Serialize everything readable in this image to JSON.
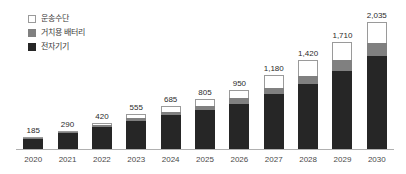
{
  "chart_data": {
    "type": "bar",
    "stacked": true,
    "title": "",
    "subtitle": "",
    "xlabel": "",
    "ylabel": "",
    "grid": false,
    "legend_position": "top-left",
    "ylim": [
      0,
      2035
    ],
    "categories": [
      "2020",
      "2021",
      "2022",
      "2023",
      "2024",
      "2025",
      "2026",
      "2027",
      "2028",
      "2029",
      "2030"
    ],
    "tick_labels": [
      "2020",
      "2021",
      "2022",
      "2023",
      "2024",
      "2025",
      "2026",
      "2027",
      "2028",
      "2029",
      "2030"
    ],
    "totals": [
      185,
      290,
      420,
      555,
      685,
      805,
      950,
      1180,
      1420,
      1710,
      2035
    ],
    "total_labels": [
      "185",
      "290",
      "420",
      "555",
      "685",
      "805",
      "950",
      "1,180",
      "1,420",
      "1,710",
      "2,035"
    ],
    "series": [
      {
        "name": "전자기기",
        "key": "electronics",
        "color": "#262626",
        "values": [
          160,
          250,
          355,
          455,
          545,
          625,
          725,
          880,
          1040,
          1255,
          1495
        ]
      },
      {
        "name": "거치용 배터리",
        "key": "stationary",
        "color": "#808080",
        "values": [
          10,
          15,
          25,
          40,
          55,
          70,
          85,
          105,
          130,
          165,
          210
        ]
      },
      {
        "name": "운송수단",
        "key": "transport",
        "color": "#ffffff",
        "values": [
          15,
          25,
          40,
          60,
          85,
          110,
          140,
          195,
          250,
          290,
          330
        ]
      }
    ]
  },
  "legend": {
    "items": [
      {
        "label": "운송수단",
        "swatch": "sw-transport",
        "icon": "legend-swatch-white-icon"
      },
      {
        "label": "거치용 배터리",
        "swatch": "sw-stationary",
        "icon": "legend-swatch-gray-icon"
      },
      {
        "label": "전자기기",
        "swatch": "sw-electronics",
        "icon": "legend-swatch-dark-icon"
      }
    ]
  },
  "colors": {
    "electronics": "#262626",
    "stationary": "#808080",
    "transport": "#ffffff",
    "transport_border": "#9a9a9a",
    "axis": "#b0b0b0",
    "label_text": "#2b2b2b",
    "tick_text": "#4a4a4a",
    "background": "#ffffff"
  }
}
